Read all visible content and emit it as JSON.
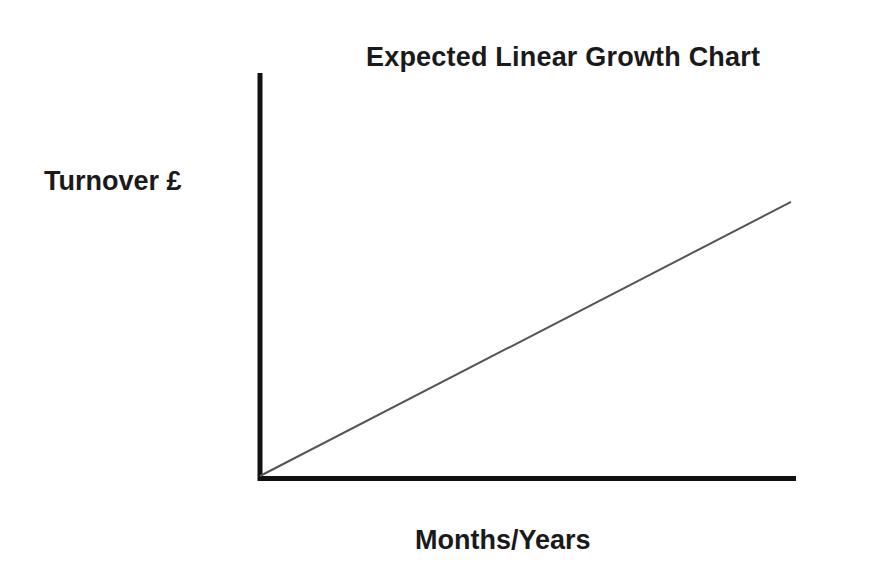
{
  "chart_data": {
    "type": "line",
    "title": "Expected Linear Growth Chart",
    "xlabel": "Months/Years",
    "ylabel": "Turnover £",
    "x": [
      0,
      1
    ],
    "series": [
      {
        "name": "Expected turnover",
        "values": [
          0,
          0.68
        ],
        "color": "#555555"
      }
    ],
    "xlim": [
      0,
      1
    ],
    "ylim": [
      0,
      1
    ],
    "grid": false,
    "legend": "none",
    "tick_labels": false,
    "axis_color": "#111111"
  }
}
